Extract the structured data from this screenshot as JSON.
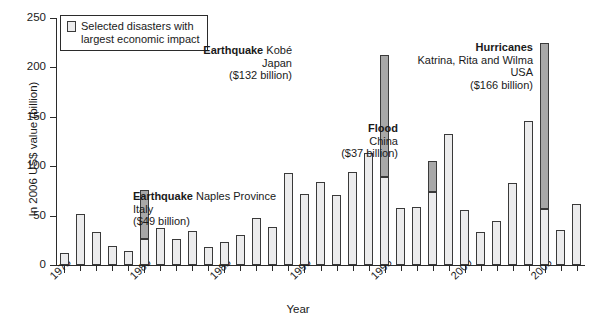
{
  "chart_data": {
    "type": "bar",
    "title": "",
    "xlabel": "Year",
    "ylabel": "In 2006 US$ value (billion)",
    "ylim": [
      0,
      250
    ],
    "ytick_labels": [
      "0",
      "50",
      "100",
      "150",
      "200",
      "250"
    ],
    "ytick_values": [
      0,
      50,
      100,
      150,
      200,
      250
    ],
    "xtick_labels": [
      "1975",
      "1980",
      "1985",
      "1990",
      "1995",
      "2000",
      "2005"
    ],
    "xtick_values": [
      1975,
      1980,
      1985,
      1990,
      1995,
      2000,
      2005
    ],
    "xlim": [
      1974.4,
      2007.6
    ],
    "grid": false,
    "legend_position": "top-left",
    "categories": [
      "1975",
      "1976",
      "1977",
      "1978",
      "1979",
      "1980",
      "1981",
      "1982",
      "1983",
      "1984",
      "1985",
      "1986",
      "1987",
      "1988",
      "1989",
      "1990",
      "1991",
      "1992",
      "1993",
      "1994",
      "1995",
      "1996",
      "1997",
      "1998",
      "1999",
      "2000",
      "2001",
      "2002",
      "2003",
      "2004",
      "2005",
      "2006",
      "2007"
    ],
    "series": [
      {
        "name": "Total economic losses",
        "values": [
          12,
          52,
          33,
          19,
          14,
          76,
          37,
          26,
          34,
          18,
          23,
          30,
          48,
          38,
          93,
          72,
          84,
          71,
          94,
          113,
          213,
          58,
          59,
          105,
          133,
          56,
          33,
          45,
          83,
          146,
          225,
          35,
          62
        ]
      },
      {
        "name": "Selected disasters with largest economic impact",
        "highlighted_years": [
          {
            "year": "1980",
            "base": 26,
            "total": 76,
            "disaster_value": 49
          },
          {
            "year": "1995",
            "base": 89,
            "total": 213,
            "disaster_value": 132
          },
          {
            "year": "1998",
            "base": 74,
            "total": 105,
            "disaster_value": 37
          },
          {
            "year": "2005",
            "base": 57,
            "total": 225,
            "disaster_value": 166
          }
        ]
      }
    ],
    "annotations": [
      {
        "id": "naples",
        "align": "left",
        "lines": [
          {
            "bold": "Earthquake",
            "rest": " Naples Province"
          },
          {
            "bold": "",
            "rest": "Italy"
          },
          {
            "bold": "",
            "rest": "($49 billion)"
          }
        ]
      },
      {
        "id": "kobe",
        "align": "right",
        "lines": [
          {
            "bold": "Earthquake",
            "rest": " Kobé"
          },
          {
            "bold": "",
            "rest": "Japan"
          },
          {
            "bold": "",
            "rest": "($132 billion)"
          }
        ]
      },
      {
        "id": "flood-china",
        "align": "right",
        "lines": [
          {
            "bold": "Flood",
            "rest": ""
          },
          {
            "bold": "",
            "rest": "China"
          },
          {
            "bold": "",
            "rest": "($37 billion)"
          }
        ]
      },
      {
        "id": "hurricanes",
        "align": "right",
        "lines": [
          {
            "bold": "Hurricanes",
            "rest": ""
          },
          {
            "bold": "",
            "rest": "Katrina, Rita and Wilma"
          },
          {
            "bold": "",
            "rest": "USA"
          },
          {
            "bold": "",
            "rest": "($166 billion)"
          }
        ]
      }
    ]
  },
  "legend": {
    "label": "Selected disasters with\nlargest economic impact",
    "swatch_color": "#ececed"
  },
  "colors": {
    "bar_fill": "#ececed",
    "bar_highlight": "#a8a8a8",
    "bar_stroke": "#3a3a3a",
    "axis": "#2b2b2b",
    "text": "#1a1a1a",
    "background": "#ffffff"
  }
}
